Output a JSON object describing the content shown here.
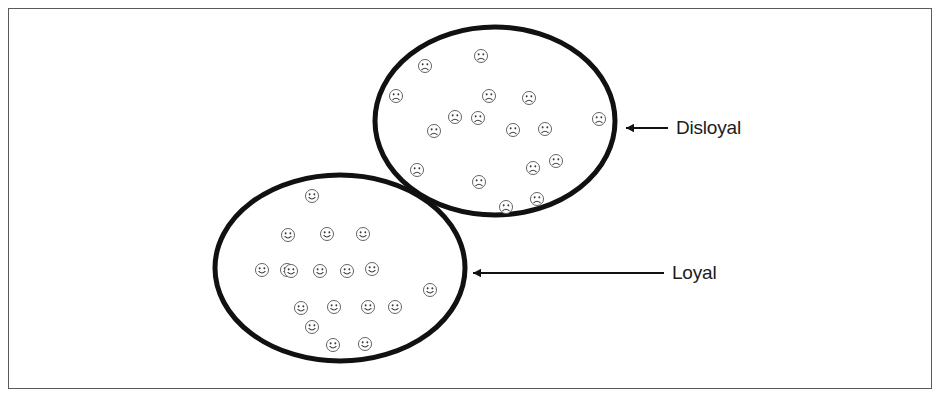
{
  "figure": {
    "background_color": "#ffffff",
    "border_color": "#5a5a5e",
    "ink_color": "#111111"
  },
  "groups": [
    {
      "id": "disloyal",
      "label": "Disloyal",
      "face_type": "frowning-face",
      "face_count": 17,
      "ellipse": {
        "cx": 495,
        "cy": 121,
        "rx": 120,
        "ry": 94
      },
      "arrow": {
        "tip_x": 617,
        "tip_y": 128,
        "tail_x": 668,
        "tail_y": 128
      },
      "label_x": 676,
      "label_y": 134,
      "faces": [
        {
          "x": 425,
          "y": 66
        },
        {
          "x": 481,
          "y": 56
        },
        {
          "x": 396,
          "y": 96
        },
        {
          "x": 489,
          "y": 96
        },
        {
          "x": 529,
          "y": 98
        },
        {
          "x": 478,
          "y": 118
        },
        {
          "x": 434,
          "y": 131
        },
        {
          "x": 513,
          "y": 130
        },
        {
          "x": 545,
          "y": 129
        },
        {
          "x": 599,
          "y": 119
        },
        {
          "x": 417,
          "y": 170
        },
        {
          "x": 479,
          "y": 182
        },
        {
          "x": 533,
          "y": 168
        },
        {
          "x": 537,
          "y": 199
        },
        {
          "x": 506,
          "y": 207
        },
        {
          "x": 455,
          "y": 117
        },
        {
          "x": 556,
          "y": 161
        }
      ]
    },
    {
      "id": "loyal",
      "label": "Loyal",
      "face_type": "smiling-face",
      "face_count": 18,
      "ellipse": {
        "cx": 340,
        "cy": 268,
        "rx": 125,
        "ry": 93
      },
      "arrow": {
        "tip_x": 464,
        "tip_y": 273,
        "tail_x": 664,
        "tail_y": 273
      },
      "label_x": 672,
      "label_y": 279,
      "faces": [
        {
          "x": 312,
          "y": 196
        },
        {
          "x": 288,
          "y": 235
        },
        {
          "x": 327,
          "y": 234
        },
        {
          "x": 363,
          "y": 234
        },
        {
          "x": 262,
          "y": 270
        },
        {
          "x": 287,
          "y": 270
        },
        {
          "x": 320,
          "y": 271
        },
        {
          "x": 372,
          "y": 269
        },
        {
          "x": 430,
          "y": 290
        },
        {
          "x": 301,
          "y": 308
        },
        {
          "x": 334,
          "y": 307
        },
        {
          "x": 368,
          "y": 307
        },
        {
          "x": 312,
          "y": 327
        },
        {
          "x": 333,
          "y": 345
        },
        {
          "x": 365,
          "y": 344
        },
        {
          "x": 347,
          "y": 271
        },
        {
          "x": 395,
          "y": 307
        },
        {
          "x": 291,
          "y": 271
        }
      ]
    }
  ]
}
